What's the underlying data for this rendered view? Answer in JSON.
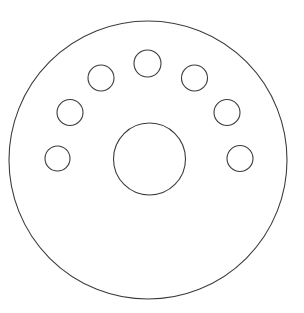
{
  "canvas": {
    "width": 304,
    "height": 313,
    "background_color": "#ffffff",
    "stroke_color": "#3c3c3c",
    "fill_color": "none"
  },
  "drawing": {
    "name": "brake-disc-rotor-outline",
    "description": "Line drawing of a circular flanged disc with a central bore and seven bolt holes arranged on an arc",
    "view": "front-elevation",
    "center": {
      "x": 148.5,
      "y": 159.5
    }
  },
  "part_outline": {
    "name": "outer-rim",
    "shape": "circle",
    "cx": 148,
    "cy": 160,
    "r": 139,
    "stroke_width": 1.1
  },
  "hub_bore": {
    "name": "center-bore",
    "shape": "circle",
    "cx": 149.5,
    "cy": 159,
    "r": 36,
    "stroke_width": 1.1
  },
  "bolt_pattern": {
    "count": 7,
    "bolt_circle_radius": 96,
    "hole_radius": 13,
    "stroke_width": 1.1,
    "holes": [
      {
        "id": "bolt-hole-1",
        "position": "top-center",
        "cx": 147.5,
        "cy": 63.5,
        "r": 13.5
      },
      {
        "id": "bolt-hole-2",
        "position": "upper-left",
        "cx": 101.0,
        "cy": 78.0,
        "r": 13.0
      },
      {
        "id": "bolt-hole-3",
        "position": "upper-right",
        "cx": 194.5,
        "cy": 78.0,
        "r": 13.0
      },
      {
        "id": "bolt-hole-4",
        "position": "middle-left",
        "cx": 70.0,
        "cy": 112.5,
        "r": 13.0
      },
      {
        "id": "bolt-hole-5",
        "position": "middle-right",
        "cx": 227.0,
        "cy": 112.5,
        "r": 13.0
      },
      {
        "id": "bolt-hole-6",
        "position": "lower-left",
        "cx": 57.5,
        "cy": 158.5,
        "r": 12.5
      },
      {
        "id": "bolt-hole-7",
        "position": "lower-right",
        "cx": 240.0,
        "cy": 158.5,
        "r": 13.0
      }
    ]
  }
}
